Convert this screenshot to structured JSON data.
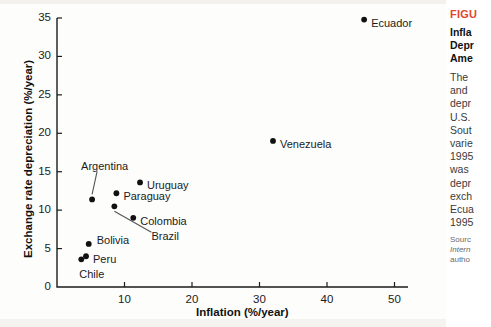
{
  "chart_data": {
    "type": "scatter",
    "title": "",
    "xlabel": "Inflation (%/year)",
    "ylabel": "Exchange rate depreciation (%/year)",
    "xlim": [
      0,
      52
    ],
    "ylim": [
      0,
      35
    ],
    "xticks": [
      10,
      20,
      30,
      40,
      50
    ],
    "yticks": [
      0,
      5,
      10,
      15,
      20,
      25,
      30,
      35
    ],
    "grid": false,
    "legend": "none",
    "point_color": "#111111",
    "points": [
      {
        "label": "Chile",
        "x": 3.6,
        "y": 3.6,
        "label_dx": -2,
        "label_dy": 16,
        "leader": false
      },
      {
        "label": "Peru",
        "x": 4.3,
        "y": 4.0,
        "label_dx": 7,
        "label_dy": 4,
        "leader": false
      },
      {
        "label": "Bolivia",
        "x": 4.7,
        "y": 5.6,
        "label_dx": 8,
        "label_dy": -3,
        "leader": false
      },
      {
        "label": "Argentina",
        "x": 5.2,
        "y": 11.4,
        "label_dx": -11,
        "label_dy": -32,
        "leader": true
      },
      {
        "label": "Brazil",
        "x": 8.5,
        "y": 10.5,
        "label_dx": 37,
        "label_dy": 31,
        "leader": true
      },
      {
        "label": "Paraguay",
        "x": 8.8,
        "y": 12.2,
        "label_dx": 7,
        "label_dy": 4,
        "leader": false
      },
      {
        "label": "Colombia",
        "x": 11.3,
        "y": 9.0,
        "label_dx": 7,
        "label_dy": 4,
        "leader": false
      },
      {
        "label": "Uruguay",
        "x": 12.3,
        "y": 13.6,
        "label_dx": 7,
        "label_dy": 4,
        "leader": false
      },
      {
        "label": "Venezuela",
        "x": 32.0,
        "y": 19.0,
        "label_dx": 7,
        "label_dy": 4,
        "leader": false
      },
      {
        "label": "Ecuador",
        "x": 45.5,
        "y": 34.8,
        "label_dx": 7,
        "label_dy": 4,
        "leader": false
      }
    ]
  },
  "caption": {
    "figure_label": "FIGU",
    "title_lines": [
      "Infla",
      "Depr",
      "Ame"
    ],
    "body_lines": [
      "The",
      "and",
      "depr",
      "U.S.",
      "Sout",
      "varie",
      "1995",
      "was",
      "depr",
      "exch",
      "Ecua",
      "1995"
    ],
    "source_lines": [
      "Sourc",
      "Intern",
      "autho"
    ],
    "accent_color": "#e2452f"
  }
}
